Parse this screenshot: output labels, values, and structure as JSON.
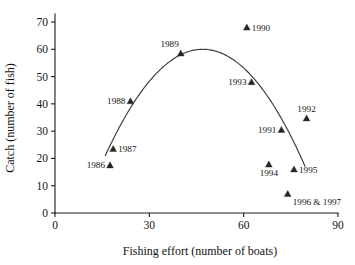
{
  "chart_data": {
    "type": "scatter",
    "title": "",
    "xlabel": "Fishing effort (number of boats)",
    "ylabel": "Catch (number of fish)",
    "xlim": [
      0,
      90
    ],
    "ylim": [
      0,
      70
    ],
    "xticks": [
      0,
      30,
      60,
      90
    ],
    "yticks": [
      0,
      10,
      20,
      30,
      40,
      50,
      60,
      70
    ],
    "xtick_labels": [
      "0",
      "30",
      "60",
      "90"
    ],
    "ytick_labels": [
      "0",
      "10",
      "20",
      "30",
      "40",
      "50",
      "60",
      "70"
    ],
    "grid": false,
    "legend": "none",
    "marker": "triangle",
    "points": [
      {
        "label": "1986",
        "x": 17.5,
        "y": 17.5,
        "label_pos": "left"
      },
      {
        "label": "1987",
        "x": 18.5,
        "y": 23.5,
        "label_pos": "right"
      },
      {
        "label": "1988",
        "x": 24.0,
        "y": 41.0,
        "label_pos": "left"
      },
      {
        "label": "1989",
        "x": 40.0,
        "y": 58.5,
        "label_pos": "above-left"
      },
      {
        "label": "1990",
        "x": 61.0,
        "y": 68.0,
        "label_pos": "right"
      },
      {
        "label": "1991",
        "x": 72.0,
        "y": 30.5,
        "label_pos": "left"
      },
      {
        "label": "1992",
        "x": 80.0,
        "y": 34.7,
        "label_pos": "above"
      },
      {
        "label": "1993",
        "x": 62.5,
        "y": 48.0,
        "label_pos": "left"
      },
      {
        "label": "1994",
        "x": 68.0,
        "y": 17.8,
        "label_pos": "below"
      },
      {
        "label": "1995",
        "x": 76.0,
        "y": 16.0,
        "label_pos": "right"
      },
      {
        "label": "1996 & 1997",
        "x": 74.0,
        "y": 7.0,
        "label_pos": "below-right"
      }
    ],
    "fitted_curve": {
      "name": "yield curve",
      "type": "parabola",
      "vertex_x": 47.0,
      "vertex_y": 60.0,
      "x_start": 16.0,
      "x_end": 79.5,
      "description": "downward-opening parabola through the catch-effort data"
    }
  },
  "colors": {
    "axis": "#1c1c1c",
    "curve": "#3a3a3a",
    "marker": "#262626",
    "text": "#141414",
    "background": "#ffffff"
  }
}
